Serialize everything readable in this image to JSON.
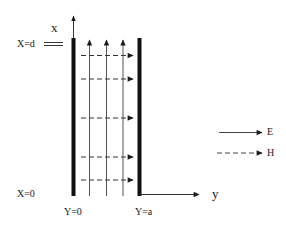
{
  "diagram": {
    "type": "parallel-plate waveguide field diagram",
    "axes": {
      "x_label": "x",
      "y_label": "y"
    },
    "boundary_labels": {
      "x_top": "X=d",
      "x_bottom": "X=0",
      "y_left": "Y=0",
      "y_right": "Y=a"
    },
    "legend": [
      {
        "label": "E",
        "style": "solid"
      },
      {
        "label": "H",
        "style": "dashed"
      }
    ],
    "plates": [
      {
        "name": "left-plate",
        "position": "Y=0"
      },
      {
        "name": "right-plate",
        "position": "Y=a"
      }
    ],
    "e_field_lines": 3,
    "h_field_lines": 5,
    "colors": {
      "line": "#1a1a1a",
      "thin_line": "#555555",
      "background": "#ffffff"
    }
  }
}
